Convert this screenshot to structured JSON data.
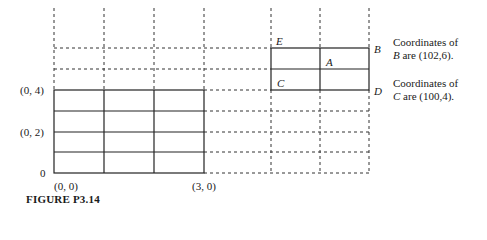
{
  "figure": {
    "caption": "FIGURE P3.14",
    "axis_labels": {
      "y4": "(0, 4)",
      "y2": "(0, 2)",
      "y0": "0",
      "origin": "(0, 0)",
      "x3": "(3, 0)"
    },
    "points": {
      "E": "E",
      "B": "B",
      "A": "A",
      "C": "C",
      "D": "D"
    },
    "notes": {
      "b_line1": "Coordinates of",
      "b_line2_var": "B",
      "b_line2_rest": " are (102,6).",
      "c_line1": "Coordinates of",
      "c_line2_var": "C",
      "c_line2_rest": " are (100,4)."
    },
    "grid": {
      "solid_left_block": {
        "cols": 3,
        "rows": 4
      },
      "solid_right_block": {
        "cols": 2,
        "rows": 2
      },
      "line_color": "#222222"
    }
  }
}
